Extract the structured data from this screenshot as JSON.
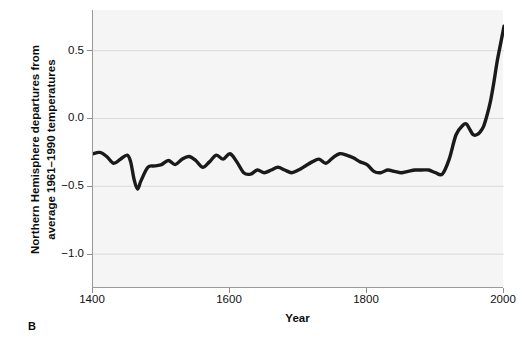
{
  "figure": {
    "panel_label": "B",
    "background_color": "#ffffff",
    "plot_background_color": "#f5f5f5",
    "line_color": "#1a1a1a",
    "grid_color": "#d9d9d9",
    "axis_color": "#9a9a9a"
  },
  "chart_data": {
    "type": "line",
    "title": "",
    "subtitle": "",
    "xlabel": "Year",
    "ylabel": "Northern Hemisphere departures from average 1961–1990 temperatures",
    "ylabel_line1": "Northern Hemisphere departures from",
    "ylabel_line2": "average 1961–1990 temperatures",
    "xlim": [
      1400,
      2000
    ],
    "ylim": [
      -1.25,
      0.8
    ],
    "xticks": [
      1400,
      1600,
      1800,
      2000
    ],
    "xtick_labels": [
      "1400",
      "1600",
      "1800",
      "2000"
    ],
    "yticks": [
      0.5,
      0.0,
      -0.5,
      -1.0
    ],
    "ytick_labels": [
      "0.5",
      "0.0",
      "−0.5",
      "−1.0"
    ],
    "grid": "horizontal",
    "legend": "none",
    "units": "degrees Celsius anomaly",
    "series": [
      {
        "name": "Northern Hemisphere temperature anomaly",
        "x": [
          1400,
          1410,
          1420,
          1430,
          1440,
          1450,
          1455,
          1460,
          1465,
          1470,
          1480,
          1490,
          1500,
          1510,
          1520,
          1530,
          1540,
          1550,
          1560,
          1570,
          1580,
          1590,
          1600,
          1610,
          1620,
          1630,
          1640,
          1650,
          1660,
          1670,
          1680,
          1690,
          1700,
          1710,
          1720,
          1730,
          1740,
          1750,
          1760,
          1770,
          1780,
          1790,
          1800,
          1810,
          1820,
          1830,
          1840,
          1850,
          1860,
          1870,
          1880,
          1890,
          1900,
          1910,
          1920,
          1930,
          1940,
          1945,
          1950,
          1955,
          1960,
          1965,
          1970,
          1975,
          1980,
          1985,
          1990,
          1995,
          2000
        ],
        "y": [
          -0.26,
          -0.25,
          -0.28,
          -0.33,
          -0.3,
          -0.27,
          -0.32,
          -0.45,
          -0.52,
          -0.46,
          -0.36,
          -0.35,
          -0.34,
          -0.31,
          -0.34,
          -0.3,
          -0.28,
          -0.31,
          -0.36,
          -0.32,
          -0.27,
          -0.3,
          -0.26,
          -0.32,
          -0.4,
          -0.41,
          -0.38,
          -0.4,
          -0.38,
          -0.36,
          -0.38,
          -0.4,
          -0.38,
          -0.35,
          -0.32,
          -0.3,
          -0.33,
          -0.29,
          -0.26,
          -0.27,
          -0.29,
          -0.32,
          -0.34,
          -0.39,
          -0.4,
          -0.38,
          -0.39,
          -0.4,
          -0.39,
          -0.38,
          -0.38,
          -0.38,
          -0.4,
          -0.41,
          -0.3,
          -0.12,
          -0.05,
          -0.04,
          -0.08,
          -0.12,
          -0.12,
          -0.1,
          -0.06,
          0.02,
          0.12,
          0.26,
          0.42,
          0.55,
          0.68
        ]
      }
    ],
    "annotations": [
      {
        "text": "B",
        "position": "bottom-left-outside"
      }
    ]
  }
}
